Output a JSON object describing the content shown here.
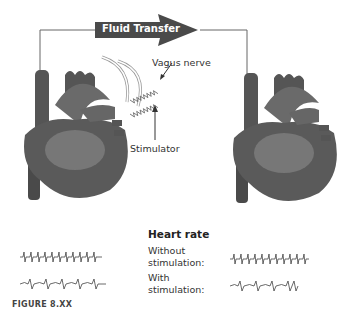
{
  "diagram": {
    "arrow_label": "Fluid Transfer",
    "labels": {
      "vagus_nerve": "Vagus nerve",
      "stimulator": "Stimulator"
    },
    "heart_rate": {
      "title": "Heart rate",
      "rows": [
        {
          "label_line1": "Without",
          "label_line2": "stimulation:",
          "pattern": "fast"
        },
        {
          "label_line1": "With",
          "label_line2": "stimulation:",
          "pattern": "slow"
        }
      ]
    },
    "caption": "FIGURE 8.XX",
    "colors": {
      "heart": "#5a5a5a",
      "heart_light": "#8a8a8a",
      "arrow": "#4a4a4a",
      "line": "#555555"
    }
  }
}
